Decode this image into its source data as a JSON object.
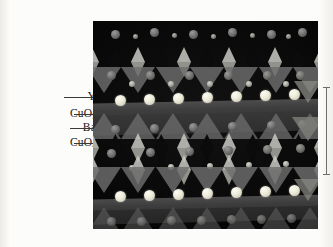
{
  "figure": {
    "type": "crystal-structure-illustration",
    "panel_background_color": "#050505"
  },
  "labels": [
    {
      "id": "y",
      "text": "Y",
      "formula_base": "Y",
      "subscript": "",
      "leader_y": 97
    },
    {
      "id": "cuo5",
      "text": "CuO",
      "formula_base": "CuO",
      "subscript": "5",
      "leader_y": 114
    },
    {
      "id": "ba",
      "text": "Ba",
      "formula_base": "Ba",
      "subscript": "",
      "leader_y": 128
    },
    {
      "id": "cuo4",
      "text": "CuO",
      "formula_base": "CuO",
      "subscript": "4",
      "leader_y": 143
    }
  ],
  "scale_bar": {
    "visible": true,
    "orientation": "vertical",
    "caption": ""
  },
  "colors": {
    "yttrium_atom": "#ecead8",
    "barium_atom": "#6f6f6d",
    "oxygen_atom": "#9c9c95",
    "copper_atom": "#7b7b76",
    "polyhedra": "#6e6e6e",
    "chain_highlight": "#c9c9c4",
    "leader_line": "#3a3a3a",
    "page_background": "#fbfbf9"
  }
}
